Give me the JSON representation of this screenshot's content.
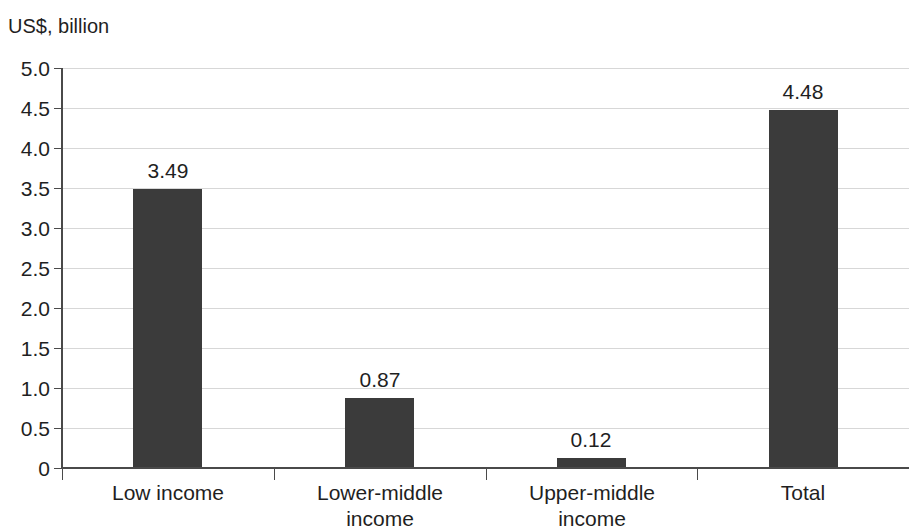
{
  "chart_data": {
    "type": "bar",
    "title": "",
    "ylabel": "US$, billion",
    "xlabel": "",
    "categories": [
      "Low income",
      "Lower-middle income",
      "Upper-middle income",
      "Total"
    ],
    "values": [
      3.49,
      0.87,
      0.12,
      4.48
    ],
    "value_labels": [
      "3.49",
      "0.87",
      "0.12",
      "4.48"
    ],
    "ylim": [
      0,
      5.0
    ],
    "ytick_values": [
      5.0,
      4.5,
      4.0,
      3.5,
      3.0,
      2.5,
      2.0,
      1.5,
      1.0,
      0.5,
      0
    ],
    "ytick_labels": [
      "5.0",
      "4.5",
      "4.0",
      "3.5",
      "3.0",
      "2.5",
      "2.0",
      "1.5",
      "1.0",
      "0.5",
      "0"
    ],
    "grid": true,
    "legend": "none",
    "bar_color": "#3b3b3b",
    "grid_color": "#d7d7d7",
    "axis_color": "#4a4a4a",
    "text_color": "#1f1f1f",
    "background": "#ffffff",
    "category_label_lines": [
      [
        "Low income"
      ],
      [
        "Lower-middle",
        "income"
      ],
      [
        "Upper-middle",
        "income"
      ],
      [
        "Total"
      ]
    ]
  }
}
